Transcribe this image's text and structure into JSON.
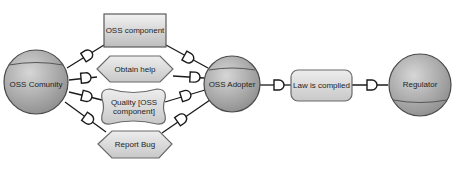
{
  "diagram": {
    "type": "i* strategic dependency model",
    "colors": {
      "actor_fill_light": "#d2d2d2",
      "actor_fill_dark": "#9a9a9a",
      "actor_stroke": "#4a4a4a",
      "element_fill_light": "#f0f0f0",
      "element_fill_dark": "#c4c4c4",
      "element_stroke": "#5a5a5a",
      "link_stroke": "#1a1a1a"
    },
    "actors": [
      {
        "id": "oss_community",
        "label": "OSS Comunity"
      },
      {
        "id": "oss_adopter",
        "label": "OSS Adopter"
      },
      {
        "id": "regulator",
        "label": "Regulator"
      }
    ],
    "dependums": [
      {
        "id": "oss_component",
        "kind": "resource",
        "label": "OSS component"
      },
      {
        "id": "obtain_help",
        "kind": "task",
        "label": "Obtain help"
      },
      {
        "id": "quality",
        "kind": "softgoal",
        "label": "Quality [OSS component]"
      },
      {
        "id": "report_bug",
        "kind": "task",
        "label": "Report Bug"
      },
      {
        "id": "law_complied",
        "kind": "goal",
        "label": "Law is complied"
      }
    ],
    "dependencies": [
      {
        "from": "oss_community",
        "via": "oss_component",
        "to": "oss_adopter"
      },
      {
        "from": "oss_community",
        "via": "obtain_help",
        "to": "oss_adopter"
      },
      {
        "from": "oss_community",
        "via": "quality",
        "to": "oss_adopter"
      },
      {
        "from": "oss_community",
        "via": "report_bug",
        "to": "oss_adopter"
      },
      {
        "from": "oss_adopter",
        "via": "law_complied",
        "to": "regulator"
      }
    ]
  }
}
